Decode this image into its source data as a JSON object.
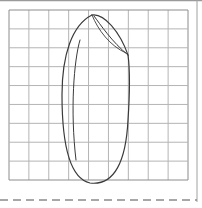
{
  "colors": {
    "background": "#ffffff",
    "paper_edge": "#9a9a9a",
    "grid_line": "#b4b4b4",
    "grid_border": "#8c8c8c",
    "stroke": "#3a3a3a",
    "dashed": "#8a8a8a"
  },
  "grid": {
    "left": 9,
    "top": 10,
    "right": 188,
    "bottom": 180,
    "columns": 9,
    "rows": 9
  },
  "drawing": {
    "description": "hand-drawn elongated oval shape on grid paper",
    "outer_path": "M 92 15 C 72 25, 62 55, 62 95 C 62 140, 68 178, 90 183 C 115 186, 126 160, 128 120 C 130 90, 130 70, 128 55",
    "top_lens_outer": "M 92 15 C 104 13, 120 32, 128 55",
    "top_lens_inner": "M 94 16 C 100 24, 112 42, 128 55",
    "top_lens_inner2": "M 92 15 C 98 30, 110 46, 126 53",
    "inner_left": "M 80 40 C 74 60, 70 110, 76 160"
  },
  "dashed_line": {
    "y": 200,
    "dash": "8 5"
  }
}
